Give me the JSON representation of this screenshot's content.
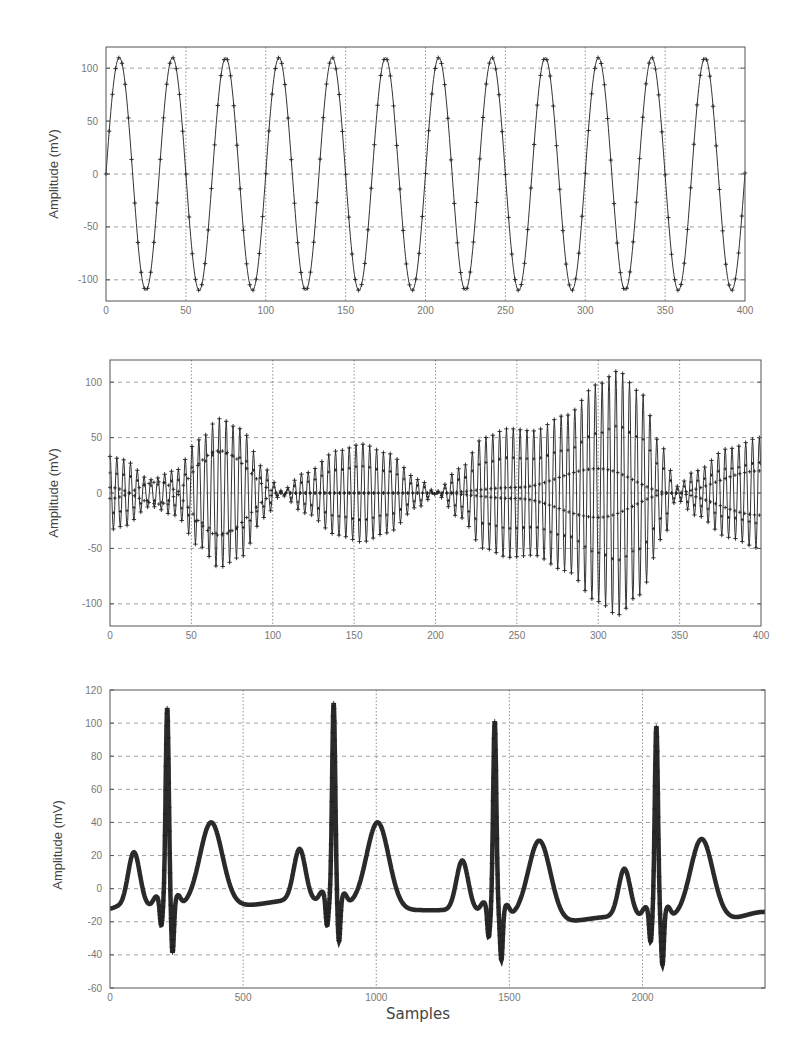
{
  "chart_data": [
    {
      "id": "sine",
      "type": "line",
      "title": "",
      "xlabel": "",
      "ylabel": "Amplitude (mV)",
      "xlim": [
        0,
        400
      ],
      "ylim": [
        -120,
        120
      ],
      "xticks": [
        0,
        50,
        100,
        150,
        200,
        250,
        300,
        350,
        400
      ],
      "yticks": [
        -100,
        -50,
        0,
        50,
        100
      ],
      "ytick_labels": [
        "-100",
        "-50",
        "0",
        "50",
        "100"
      ],
      "grid": true,
      "marker": "+",
      "series": [
        {
          "name": "sine",
          "function": "A*sin(2*pi*x/T)",
          "amplitude": 110,
          "period": 33.33,
          "sample_step": 2,
          "x_range": [
            0,
            400
          ]
        }
      ],
      "box": {
        "left": 106,
        "top": 47,
        "right": 745,
        "bottom": 301
      }
    },
    {
      "id": "am-signal",
      "type": "line",
      "title": "",
      "xlabel": "",
      "ylabel": "Amplitude (mV)",
      "xlim": [
        0,
        400
      ],
      "ylim": [
        -120,
        120
      ],
      "xticks": [
        0,
        50,
        100,
        150,
        200,
        250,
        300,
        350,
        400
      ],
      "yticks": [
        -100,
        -50,
        0,
        50,
        100
      ],
      "ytick_labels": [
        "-100",
        "-50",
        "0",
        "50",
        "100"
      ],
      "grid": true,
      "marker": "+",
      "series": [
        {
          "name": "modulated",
          "description": "high-frequency carrier with varying amplitude envelope",
          "carrier_period": 4.2,
          "envelope": {
            "x": [
              0,
              8,
              25,
              40,
              55,
              67,
              80,
              95,
              105,
              120,
              140,
              155,
              170,
              190,
              200,
              215,
              230,
              245,
              260,
              280,
              300,
              312,
              325,
              340,
              348,
              360,
              380,
              400
            ],
            "y": [
              33,
              30,
              12,
              20,
              48,
              67,
              58,
              22,
              2,
              18,
              38,
              44,
              36,
              12,
              1,
              22,
              50,
              58,
              56,
              70,
              98,
              110,
              92,
              40,
              6,
              20,
              40,
              50
            ]
          }
        },
        {
          "name": "slow-component",
          "description": "low-frequency component visible as thicker marker line",
          "x": [
            0,
            30,
            67,
            105,
            200,
            250,
            300,
            345,
            400
          ],
          "y": [
            5,
            -10,
            38,
            0,
            0,
            5,
            22,
            0,
            -20
          ]
        }
      ],
      "box": {
        "left": 110,
        "top": 360,
        "right": 761,
        "bottom": 626
      }
    },
    {
      "id": "ecg",
      "type": "line",
      "title": "",
      "xlabel": "Samples",
      "ylabel": "Amplitude (mV)",
      "xlim": [
        0,
        2460
      ],
      "ylim": [
        -60,
        120
      ],
      "xticks": [
        0,
        500,
        1000,
        1500,
        2000
      ],
      "yticks": [
        -60,
        -40,
        -20,
        0,
        20,
        40,
        60,
        80,
        100,
        120
      ],
      "ytick_labels": [
        "-60",
        "-40",
        "-20",
        "0",
        "20",
        "40",
        "60",
        "80",
        "100",
        "120"
      ],
      "grid": true,
      "marker": "+",
      "beats": [
        {
          "P": [
            90,
            20
          ],
          "Q": [
            192,
            -24
          ],
          "R": [
            215,
            109
          ],
          "S": [
            235,
            -40
          ],
          "T": [
            380,
            38
          ]
        },
        {
          "P": [
            712,
            22
          ],
          "Q": [
            815,
            -24
          ],
          "R": [
            840,
            112
          ],
          "S": [
            860,
            -33
          ],
          "T": [
            1005,
            38
          ]
        },
        {
          "P": [
            1323,
            15
          ],
          "Q": [
            1422,
            -31
          ],
          "R": [
            1445,
            101
          ],
          "S": [
            1470,
            -44
          ],
          "T": [
            1612,
            27
          ]
        },
        {
          "P": [
            1932,
            10
          ],
          "Q": [
            2030,
            -34
          ],
          "R": [
            2052,
            98
          ],
          "S": [
            2075,
            -47
          ],
          "T": [
            2222,
            28
          ]
        }
      ],
      "baseline": {
        "x": [
          0,
          30,
          500,
          690,
          1110,
          1290,
          1690,
          1890,
          2320,
          2460
        ],
        "y": [
          -12,
          -11,
          -10,
          -7,
          -13,
          -13,
          -20,
          -17,
          -18,
          -14
        ]
      },
      "box": {
        "left": 110,
        "top": 690,
        "right": 765,
        "bottom": 988
      }
    }
  ],
  "labels": {
    "ylabel_1": "Amplitude (mV)",
    "ylabel_2": "Amplitude (mV)",
    "ylabel_3": "Amplitude (mV)",
    "xlabel_3": "Samples"
  }
}
